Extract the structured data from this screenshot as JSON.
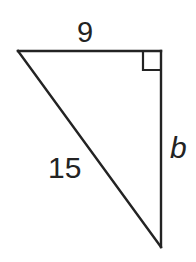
{
  "figure": {
    "kind": "right-triangle-diagram",
    "background_color": "#ffffff",
    "stroke_color": "#232323",
    "stroke_width": 2.4,
    "vertices": {
      "top_left": [
        18,
        51
      ],
      "top_right": [
        161,
        51
      ],
      "bottom_right": [
        161,
        247
      ]
    },
    "right_angle": {
      "at_vertex": "top_right",
      "marker": "square",
      "marker_size": 18
    },
    "labels": {
      "top_side": "9",
      "hypotenuse": "15",
      "vertical_side": "b"
    },
    "label_styles": {
      "top_side_italic": false,
      "hypotenuse_italic": false,
      "vertical_side_italic": true
    }
  }
}
